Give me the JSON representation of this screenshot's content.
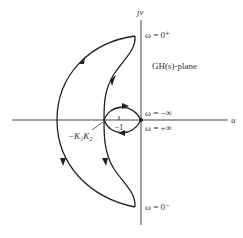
{
  "diagram": {
    "type": "nyquist-plot",
    "plane_label": "GH(s)-plane",
    "axes": {
      "horizontal_label": "u",
      "vertical_label": "jv"
    },
    "annotations": {
      "omega_zero_plus": "ω = 0⁺",
      "omega_zero_minus": "ω = 0⁻",
      "omega_neg_inf": "ω = −∞",
      "omega_pos_inf": "ω = +∞",
      "critical_point": "−1",
      "crossing_point": "−K₁K₂"
    },
    "colors": {
      "stroke": "#222222",
      "axis": "#444444",
      "text": "#333333",
      "background": "#ffffff"
    }
  }
}
